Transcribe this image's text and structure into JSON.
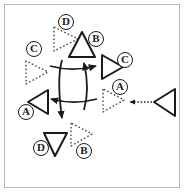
{
  "figure": {
    "background_color": "#ffffff",
    "frame_color": "#b8b8b8",
    "stroke_color": "#1a1a1a",
    "dotted_color": "#555555",
    "width": 186,
    "height": 194
  },
  "labels": [
    {
      "id": "label-d-top",
      "text": "D",
      "x": 58,
      "y": 14
    },
    {
      "id": "label-b-top",
      "text": "B",
      "x": 88,
      "y": 31
    },
    {
      "id": "label-c-left",
      "text": "C",
      "x": 26,
      "y": 41
    },
    {
      "id": "label-c-right",
      "text": "C",
      "x": 117,
      "y": 52
    },
    {
      "id": "label-a-right",
      "text": "A",
      "x": 112,
      "y": 79
    },
    {
      "id": "label-a-left",
      "text": "A",
      "x": 18,
      "y": 104
    },
    {
      "id": "label-d-bottom",
      "text": "D",
      "x": 33,
      "y": 140
    },
    {
      "id": "label-b-bottom",
      "text": "B",
      "x": 76,
      "y": 143
    }
  ],
  "shapes": [
    {
      "id": "triangle-d-top",
      "label": "D",
      "style": "dotted",
      "direction": "right",
      "cx": 64,
      "cy": 39
    },
    {
      "id": "triangle-b-top",
      "label": "B",
      "style": "solid",
      "direction": "up",
      "cx": 82,
      "cy": 46
    },
    {
      "id": "triangle-c-left",
      "label": "C",
      "style": "dotted",
      "direction": "right",
      "cx": 35,
      "cy": 72
    },
    {
      "id": "triangle-c-right",
      "label": "C",
      "style": "solid",
      "direction": "right",
      "cx": 111,
      "cy": 67
    },
    {
      "id": "triangle-a-right",
      "label": "A",
      "style": "dotted",
      "direction": "right",
      "cx": 113,
      "cy": 100
    },
    {
      "id": "triangle-a-left",
      "label": "A",
      "style": "solid",
      "direction": "left",
      "cx": 38,
      "cy": 102
    },
    {
      "id": "triangle-d-bottom",
      "label": "D",
      "style": "solid",
      "direction": "down",
      "cx": 55,
      "cy": 144
    },
    {
      "id": "triangle-b-bottom",
      "label": "B",
      "style": "dotted",
      "direction": "right",
      "cx": 80,
      "cy": 134
    },
    {
      "id": "triangle-source",
      "label": "",
      "style": "solid",
      "direction": "left",
      "cx": 166,
      "cy": 102
    }
  ],
  "arrows": [
    {
      "id": "rotation-arrow-up",
      "direction": "up",
      "style": "solid"
    },
    {
      "id": "rotation-arrow-right",
      "direction": "right",
      "style": "solid"
    },
    {
      "id": "rotation-arrow-down",
      "direction": "down",
      "style": "solid"
    },
    {
      "id": "rotation-arrow-left",
      "direction": "left",
      "style": "solid"
    },
    {
      "id": "transfer-arrow",
      "direction": "left",
      "style": "dotted"
    }
  ]
}
